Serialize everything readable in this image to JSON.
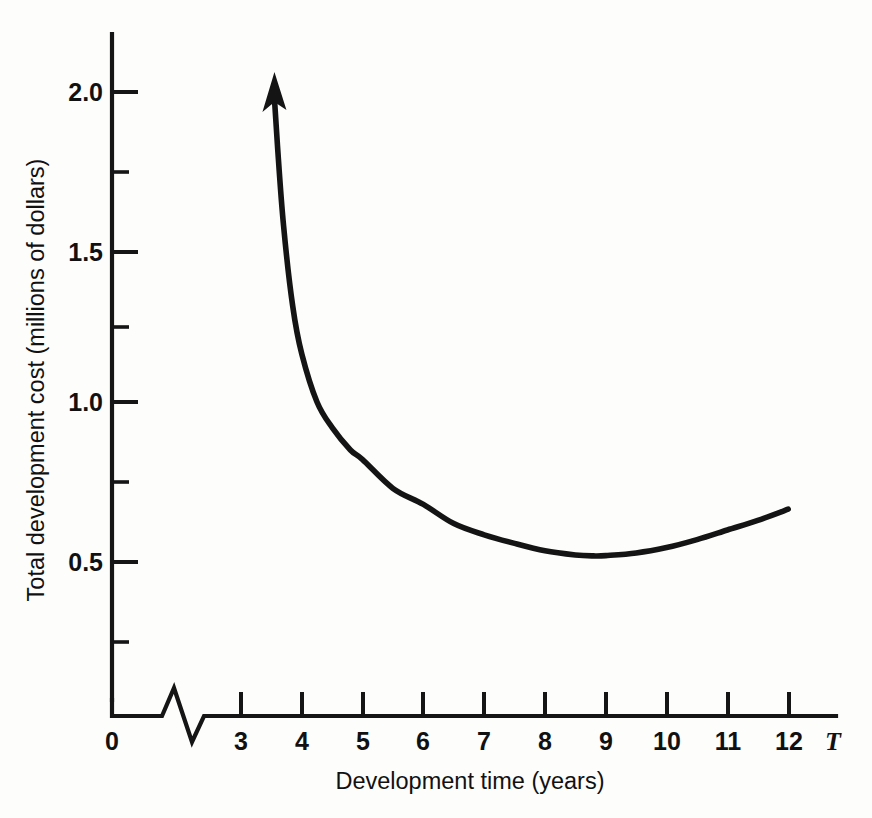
{
  "figure": {
    "background_color": "#fdfdfc",
    "ink_color": "#141414"
  },
  "chart_data": {
    "type": "line",
    "title": "",
    "subtitle": "",
    "xlabel": "Development time (years)",
    "ylabel": "Total development cost (millions of dollars)",
    "x_axis_variable": "T",
    "xlim": [
      2.4,
      12.9
    ],
    "ylim": [
      0.0,
      2.15
    ],
    "x_axis_has_break": true,
    "x_axis_break_note": "zigzag break between 0 and 3",
    "grid": false,
    "legend": null,
    "x_tick_labels": [
      "0",
      "3",
      "4",
      "5",
      "6",
      "7",
      "8",
      "9",
      "10",
      "11",
      "12"
    ],
    "x_major_ticks": [
      3,
      4,
      5,
      6,
      7,
      8,
      9,
      10,
      11,
      12
    ],
    "y_tick_labels": [
      "0.5",
      "1.0",
      "1.5",
      "2.0"
    ],
    "y_major_ticks": [
      0.5,
      1.0,
      1.5,
      2.0
    ],
    "y_minor_ticks": [
      0.25,
      0.75,
      1.25,
      1.75
    ],
    "origin_label": "0",
    "series": [
      {
        "name": "Total development cost",
        "arrow_at_start": true,
        "arrow_direction": "up",
        "x": [
          3.55,
          3.6,
          3.7,
          3.85,
          4.0,
          4.25,
          4.5,
          4.8,
          5.0,
          5.5,
          6.0,
          6.5,
          7.0,
          7.5,
          8.0,
          8.5,
          8.8,
          9.0,
          9.5,
          10.0,
          10.5,
          11.0,
          11.5,
          12.0
        ],
        "y": [
          1.95,
          1.8,
          1.55,
          1.3,
          1.15,
          1.0,
          0.92,
          0.85,
          0.82,
          0.73,
          0.68,
          0.62,
          0.585,
          0.558,
          0.535,
          0.522,
          0.519,
          0.52,
          0.528,
          0.545,
          0.57,
          0.6,
          0.63,
          0.665
        ]
      }
    ]
  }
}
